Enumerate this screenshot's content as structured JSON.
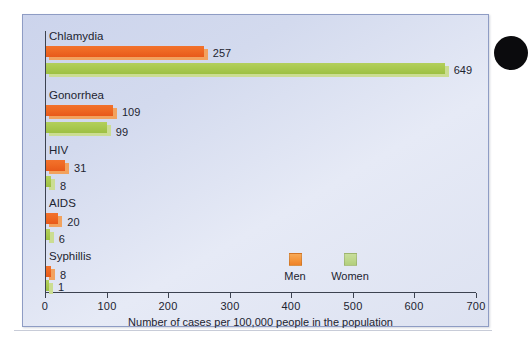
{
  "chart_data": {
    "type": "bar",
    "orientation": "horizontal",
    "title": "",
    "xlabel": "Number of cases per 100,000 people in the population",
    "ylabel": "",
    "xlim": [
      0,
      700
    ],
    "xticks": [
      0,
      100,
      200,
      300,
      400,
      500,
      600,
      700
    ],
    "xtick_labels": [
      "0",
      "100",
      "200",
      "300",
      "400",
      "500",
      "600",
      "700"
    ],
    "grid": false,
    "legend_position": "inside-center-bottom",
    "categories": [
      "Chlamydia",
      "Gonorrhea",
      "HIV",
      "AIDS",
      "Syphillis"
    ],
    "series": [
      {
        "name": "Men",
        "color": "#ef6a24",
        "values": [
          257,
          109,
          31,
          20,
          8
        ],
        "value_labels": [
          "257",
          "109",
          "31",
          "20",
          "8"
        ]
      },
      {
        "name": "Women",
        "color": "#a9c94f",
        "values": [
          649,
          99,
          8,
          6,
          1
        ],
        "value_labels": [
          "649",
          "99",
          "8",
          "6",
          "1"
        ]
      }
    ],
    "legend": [
      {
        "label": "Men",
        "color": "#f49338"
      },
      {
        "label": "Women",
        "color": "#bcd689"
      }
    ]
  },
  "panel": {
    "background": "#d6dcee",
    "border_color": "#8e9cc4"
  },
  "decoration": {
    "margin_dot_color": "#0b0b0d",
    "rule_color": "#c8ccd8"
  }
}
